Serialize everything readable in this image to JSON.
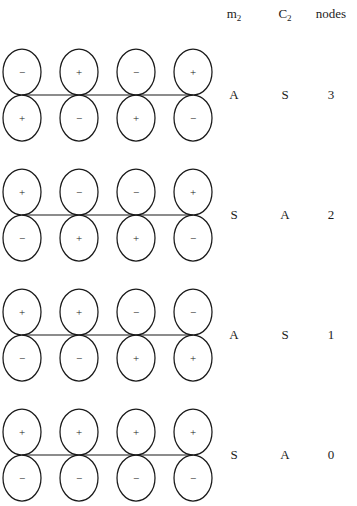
{
  "figure": {
    "line_color": "#1a1a1a",
    "background_color": "#ffffff"
  },
  "columns": {
    "m2_label": "m",
    "m2_sub": "2",
    "c2_label": "C",
    "c2_sub": "2",
    "nodes_label": "nodes"
  },
  "chart_data": {
    "type": "diagram",
    "xlabel": "",
    "ylabel": "",
    "legend": [
      "m2",
      "C2",
      "nodes"
    ],
    "n_orbitals_per_row": 4,
    "rows": [
      {
        "index": 0,
        "top_signs": [
          "−",
          "+",
          "−",
          "+"
        ],
        "bottom_signs": [
          "+",
          "−",
          "+",
          "−"
        ],
        "m2": "A",
        "c2": "S",
        "nodes": "3"
      },
      {
        "index": 1,
        "top_signs": [
          "+",
          "−",
          "−",
          "+"
        ],
        "bottom_signs": [
          "−",
          "+",
          "+",
          "−"
        ],
        "m2": "S",
        "c2": "A",
        "nodes": "2"
      },
      {
        "index": 2,
        "top_signs": [
          "+",
          "+",
          "−",
          "−"
        ],
        "bottom_signs": [
          "−",
          "−",
          "+",
          "+"
        ],
        "m2": "A",
        "c2": "S",
        "nodes": "1"
      },
      {
        "index": 3,
        "top_signs": [
          "+",
          "+",
          "+",
          "+"
        ],
        "bottom_signs": [
          "−",
          "−",
          "−",
          "−"
        ],
        "m2": "S",
        "c2": "A",
        "nodes": "0"
      }
    ]
  },
  "geometry": {
    "row_tops": [
      35,
      155,
      275,
      395
    ],
    "orbital_centers_x": [
      22,
      79,
      136,
      193
    ],
    "axis_y_in_row": 60,
    "lobe_rx": 19,
    "lobe_ry": 23
  }
}
